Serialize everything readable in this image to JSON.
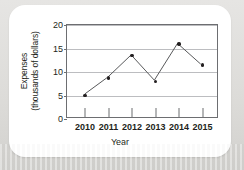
{
  "chart_data": {
    "type": "line",
    "title": "",
    "xlabel": "Year",
    "ylabel": "Expenses (thousands of dollars)",
    "ylabel_lines": [
      "Expenses",
      "(thousands of dollars)"
    ],
    "categories": [
      "2010",
      "2011",
      "2012",
      "2013",
      "2014",
      "2015"
    ],
    "values": [
      5.0,
      8.7,
      13.5,
      8.0,
      16.0,
      11.5
    ],
    "series": [
      {
        "name": "Expenses",
        "values": [
          5.0,
          8.7,
          13.5,
          8.0,
          16.0,
          11.5
        ]
      }
    ],
    "ylim": [
      0,
      20
    ],
    "yticks": [
      0,
      5,
      10,
      15,
      20
    ],
    "ytick_labels": [
      "0",
      "5",
      "10",
      "15",
      "20"
    ],
    "xtick_labels": [
      "2010",
      "2011",
      "2012",
      "2013",
      "2014",
      "2015"
    ],
    "grid": true,
    "grid_axis": "y",
    "legend": false,
    "legend_position": "none",
    "line_color": "#58595b",
    "marker_color": "#231f20",
    "marker": "circle",
    "axis_color": "#6d6e71",
    "grid_color": "#bcbdc0",
    "background_color": "#ffffff",
    "page_background_color": "#dcdbd8"
  }
}
